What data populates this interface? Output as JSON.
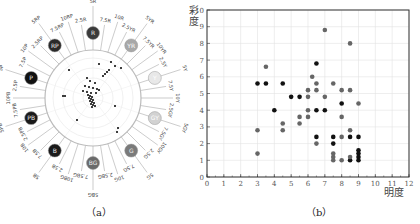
{
  "captions": {
    "a": "（a）",
    "b": "（b）"
  },
  "hue_ring": {
    "labels": [
      "5R",
      "7.5R",
      "10R",
      "2.5YR",
      "5YR",
      "7.5YR",
      "10YR",
      "2.5Y",
      "5Y",
      "7.5Y",
      "10Y",
      "2.5GY",
      "5GY",
      "7.5GY",
      "10GY",
      "2.5G",
      "5G",
      "7.5G",
      "10G",
      "2.5BG",
      "5BG",
      "7.5BG",
      "10BG",
      "2.5B",
      "5B",
      "7.5B",
      "10B",
      "2.5PB",
      "5PB",
      "7.5PB",
      "10PB",
      "2.5P",
      "5P",
      "7.5P",
      "10P",
      "2.5RP",
      "5RP",
      "7.5RP",
      "10RP",
      "2.5R"
    ],
    "major_badges": [
      {
        "label": "R",
        "angle": 0,
        "color": "#3a3a3a"
      },
      {
        "label": "YR",
        "angle": 36,
        "color": "#a8a8a8"
      },
      {
        "label": "Y",
        "angle": 72,
        "color": "#e8e8e8"
      },
      {
        "label": "GY",
        "angle": 108,
        "color": "#d2d2d2"
      },
      {
        "label": "G",
        "angle": 144,
        "color": "#7a7a7a"
      },
      {
        "label": "BG",
        "angle": 180,
        "color": "#6a6a6a"
      },
      {
        "label": "B",
        "angle": 216,
        "color": "#1a1a1a"
      },
      {
        "label": "PB",
        "angle": 252,
        "color": "#1a1a1a"
      },
      {
        "label": "P",
        "angle": 288,
        "color": "#111111"
      },
      {
        "label": "RP",
        "angle": 324,
        "color": "#2a2a2a"
      }
    ]
  },
  "chart_data": [
    {
      "type": "scatter",
      "title": "Hue distribution (Munsell hue circle)",
      "subplot": "(a)",
      "categories_angular": [
        "5R",
        "7.5R",
        "10R",
        "2.5YR",
        "5YR",
        "7.5YR",
        "10YR",
        "2.5Y",
        "5Y",
        "7.5Y",
        "10Y",
        "2.5GY",
        "5GY",
        "7.5GY",
        "10GY",
        "2.5G",
        "5G",
        "7.5G",
        "10G",
        "2.5BG",
        "5BG",
        "7.5BG",
        "10BG",
        "2.5B",
        "5B",
        "7.5B",
        "10B",
        "2.5PB",
        "5PB",
        "7.5PB",
        "10PB",
        "2.5P",
        "5P",
        "7.5P",
        "10P",
        "2.5RP",
        "5RP",
        "7.5RP",
        "10RP",
        "2.5R"
      ],
      "note": "Points clustered near center, concentrated in R–YR–RP direction"
    },
    {
      "type": "scatter",
      "subplot": "(b)",
      "xlabel": "明度",
      "ylabel": "彩度",
      "xlim": [
        0,
        12
      ],
      "ylim": [
        0,
        10
      ],
      "xticks": [
        0,
        1,
        2,
        3,
        4,
        5,
        6,
        7,
        8,
        9,
        10,
        11,
        12
      ],
      "yticks": [
        0,
        1,
        2,
        3,
        4,
        5,
        6,
        7,
        8,
        9,
        10
      ],
      "grid": true,
      "series": [
        {
          "name": "dark",
          "color": "#111111",
          "points": [
            [
              3,
              5.6
            ],
            [
              3.5,
              5.6
            ],
            [
              4,
              4.0
            ],
            [
              4.5,
              5.6
            ],
            [
              5,
              4.8
            ],
            [
              5.5,
              4.8
            ],
            [
              6.5,
              6.8
            ],
            [
              6.5,
              4.0
            ],
            [
              6.5,
              2.4
            ],
            [
              7,
              4.0
            ],
            [
              7.5,
              2.4
            ],
            [
              7.5,
              2.0
            ],
            [
              8,
              4.4
            ],
            [
              8.5,
              2.4
            ],
            [
              8.5,
              1.0
            ],
            [
              9,
              2.4
            ],
            [
              9,
              1.6
            ],
            [
              9,
              1.4
            ],
            [
              9,
              1.2
            ],
            [
              9,
              1.0
            ]
          ]
        },
        {
          "name": "gray",
          "color": "#666666",
          "points": [
            [
              3,
              2.8
            ],
            [
              3,
              1.4
            ],
            [
              3.5,
              6.6
            ],
            [
              4.5,
              3.2
            ],
            [
              4.5,
              2.8
            ],
            [
              5.5,
              3.6
            ],
            [
              5.5,
              3.2
            ],
            [
              6,
              5.2
            ],
            [
              6,
              4.8
            ],
            [
              6,
              4.0
            ],
            [
              6,
              3.6
            ],
            [
              6.25,
              6.0
            ],
            [
              6.5,
              5.6
            ],
            [
              6.5,
              5.2
            ],
            [
              6.5,
              2.0
            ],
            [
              7,
              8.8
            ],
            [
              7,
              4.8
            ],
            [
              7.5,
              5.6
            ],
            [
              7.5,
              1.4
            ],
            [
              7.5,
              1.2
            ],
            [
              7.5,
              1.0
            ],
            [
              8,
              5.2
            ],
            [
              8,
              3.6
            ],
            [
              8,
              2.4
            ],
            [
              8,
              1.0
            ],
            [
              8.5,
              8.0
            ],
            [
              8.5,
              5.2
            ],
            [
              8.5,
              2.8
            ],
            [
              8.5,
              1.2
            ],
            [
              9,
              4.4
            ]
          ]
        }
      ]
    }
  ],
  "polar_points": [
    [
      -6,
      -20
    ],
    [
      -3,
      -17
    ],
    [
      2,
      -15
    ],
    [
      -8,
      -12
    ],
    [
      -4,
      -11
    ],
    [
      0,
      -10
    ],
    [
      4,
      -9
    ],
    [
      6,
      -8
    ],
    [
      -10,
      -7
    ],
    [
      -6,
      -6
    ],
    [
      -2,
      -5
    ],
    [
      3,
      -5
    ],
    [
      -5,
      -3
    ],
    [
      -3,
      -2
    ],
    [
      -1,
      -1
    ],
    [
      -4,
      0
    ],
    [
      -2,
      1
    ],
    [
      0,
      2
    ],
    [
      -3,
      3
    ],
    [
      -1,
      4
    ],
    [
      1,
      5
    ],
    [
      -2,
      6
    ],
    [
      0,
      7
    ],
    [
      2,
      8
    ],
    [
      -1,
      9
    ],
    [
      10,
      -22
    ],
    [
      16,
      -28
    ],
    [
      22,
      -32
    ],
    [
      28,
      -30
    ],
    [
      12,
      -24
    ],
    [
      14,
      -26
    ],
    [
      -28,
      -2
    ],
    [
      -16,
      22
    ],
    [
      22,
      8
    ],
    [
      25,
      30
    ],
    [
      24,
      34
    ],
    [
      -30,
      -2
    ],
    [
      -24,
      -28
    ],
    [
      6,
      -34
    ],
    [
      18,
      -36
    ]
  ]
}
